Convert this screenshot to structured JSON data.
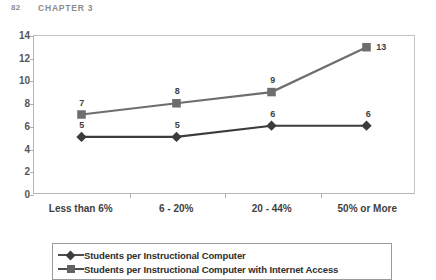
{
  "page_header": {
    "folio": "82",
    "chapter": "CHAPTER 3"
  },
  "legend": {
    "items": [
      {
        "label": "Students per Instructional Computer",
        "marker": "diamond",
        "color": "#3c3c3c"
      },
      {
        "label": "Students per Instructional Computer with Internet Access",
        "marker": "square",
        "color": "#636363"
      }
    ]
  },
  "chart_data": {
    "type": "line",
    "title": "",
    "xlabel": "",
    "ylabel": "",
    "categories": [
      "Less than 6%",
      "6 - 20%",
      "20 - 44%",
      "50% or More"
    ],
    "ylim": [
      0,
      14
    ],
    "yticks": [
      0,
      2,
      4,
      6,
      8,
      10,
      12,
      14
    ],
    "ytick_labels": [
      "0",
      "2",
      "4",
      "6",
      "8",
      "10",
      "12",
      "14"
    ],
    "grid": false,
    "legend_position": "bottom",
    "data_labels": true,
    "series": [
      {
        "name": "Students per Instructional Computer",
        "marker": "diamond",
        "color": "#3c3c3c",
        "values": [
          5,
          5,
          6,
          6
        ],
        "labels": [
          "5",
          "5",
          "6",
          "6"
        ]
      },
      {
        "name": "Students per Instructional Computer with Internet Access",
        "marker": "square",
        "color": "#6e6e6e",
        "values": [
          7,
          8,
          9,
          13
        ],
        "labels": [
          "7",
          "8",
          "9",
          "13"
        ]
      }
    ]
  }
}
